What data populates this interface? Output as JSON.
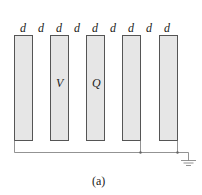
{
  "diagram": {
    "spacing_labels": [
      "d",
      "d",
      "d",
      "d",
      "d",
      "d",
      "d",
      "d",
      "d"
    ],
    "plate_labels": {
      "plate_2": "V",
      "plate_3": "Q"
    },
    "caption": "(a)",
    "colors": {
      "plate_fill": "#e6e6e6",
      "plate_stroke": "#555555",
      "wire": "#777777"
    }
  }
}
